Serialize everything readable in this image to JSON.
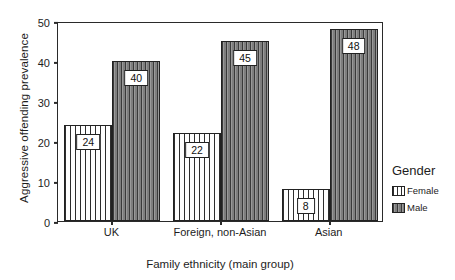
{
  "chart_data": {
    "type": "bar",
    "title": "",
    "xlabel": "Family ethnicity (main group)",
    "ylabel": "Aggressive offending prevalence",
    "categories": [
      "UK",
      "Foreign, non-Asian",
      "Asian"
    ],
    "series": [
      {
        "name": "Female",
        "values": [
          24,
          22,
          8
        ],
        "fill": "#ffffff",
        "pattern": "vertical-lines"
      },
      {
        "name": "Male",
        "values": [
          40,
          45,
          48
        ],
        "fill": "#8d8d8d",
        "pattern": "vertical-lines"
      }
    ],
    "ylim": [
      0,
      50
    ],
    "yticks": [
      0,
      10,
      20,
      30,
      40,
      50
    ],
    "ytick_labels": [
      "0",
      "10",
      "20",
      "30",
      "40",
      "50"
    ],
    "grid": false,
    "data_labels": true,
    "legend": {
      "title": "Gender",
      "position": "right",
      "entries": [
        "Female",
        "Male"
      ]
    }
  },
  "legend": {
    "title": "Gender",
    "items": [
      {
        "label": "Female",
        "swatch": "female-swatch-icon"
      },
      {
        "label": "Male",
        "swatch": "male-swatch-icon"
      }
    ]
  },
  "axes": {
    "y_title": "Aggressive offending prevalence",
    "x_title": "Family ethnicity (main group)"
  }
}
